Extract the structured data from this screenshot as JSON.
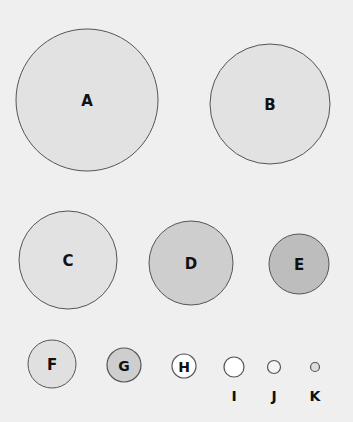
{
  "background": "#efefef",
  "stroke": "#555555",
  "circles": [
    {
      "label": "A",
      "cx": 87,
      "cy": 100,
      "r": 71,
      "fill": "#e2e2e2",
      "label_inside": true
    },
    {
      "label": "B",
      "cx": 270,
      "cy": 104,
      "r": 60,
      "fill": "#e2e2e2",
      "label_inside": true
    },
    {
      "label": "C",
      "cx": 68,
      "cy": 260,
      "r": 49,
      "fill": "#e2e2e2",
      "label_inside": true
    },
    {
      "label": "D",
      "cx": 191,
      "cy": 263,
      "r": 42,
      "fill": "#cecece",
      "label_inside": true
    },
    {
      "label": "E",
      "cx": 299,
      "cy": 264,
      "r": 30,
      "fill": "#bdbdbd",
      "label_inside": true
    },
    {
      "label": "F",
      "cx": 52,
      "cy": 364,
      "r": 24,
      "fill": "#e0e0e0",
      "label_inside": true
    },
    {
      "label": "G",
      "cx": 124,
      "cy": 365,
      "r": 17,
      "fill": "#cecece",
      "label_inside": true
    },
    {
      "label": "H",
      "cx": 184,
      "cy": 366,
      "r": 12,
      "fill": "#ffffff",
      "label_inside": true
    },
    {
      "label": "I",
      "cx": 234,
      "cy": 367,
      "r": 10,
      "fill": "#ffffff",
      "label_inside": false
    },
    {
      "label": "J",
      "cx": 274,
      "cy": 367,
      "r": 6.5,
      "fill": "#f4f4f4",
      "label_inside": false
    },
    {
      "label": "K",
      "cx": 315,
      "cy": 367,
      "r": 4.5,
      "fill": "#dddddd",
      "label_inside": false
    }
  ]
}
